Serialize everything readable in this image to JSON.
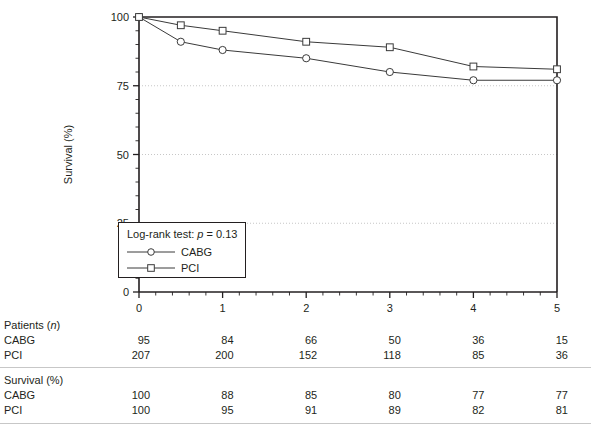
{
  "chart_data": {
    "type": "line",
    "title": "",
    "xlabel": "Years post-treatment",
    "ylabel": "Survival (%)",
    "xlim": [
      0,
      5
    ],
    "ylim": [
      0,
      100
    ],
    "xticks": [
      "0",
      "1",
      "2",
      "3",
      "4",
      "5"
    ],
    "yticks": [
      "0",
      "25",
      "50",
      "75",
      "100"
    ],
    "grid": "horizontal dotted at 25, 50, 75",
    "legend_position": "inset lower-left",
    "annotation": "Log-rank test: p = 0.13",
    "x": [
      0,
      0.5,
      1,
      2,
      3,
      4,
      5
    ],
    "series": [
      {
        "name": "CABG",
        "marker": "circle-open",
        "values": [
          100,
          91,
          88,
          85,
          80,
          77,
          77
        ]
      },
      {
        "name": "PCI",
        "marker": "square-open",
        "values": [
          100,
          97,
          95,
          91,
          89,
          82,
          81
        ]
      }
    ]
  },
  "legend": {
    "stat_prefix": "Log-rank test: ",
    "stat_italic": "p",
    "stat_suffix": " = 0.13",
    "entries": [
      {
        "label": "CABG",
        "marker": "circle-open-icon"
      },
      {
        "label": "PCI",
        "marker": "square-open-icon"
      }
    ]
  },
  "axes": {
    "y_title": "Survival (%)",
    "x_title": "Years post-treatment",
    "y_tick_labels": [
      "100",
      "75",
      "50",
      "25",
      "0"
    ],
    "x_tick_labels": [
      "0",
      "1",
      "2",
      "3",
      "4",
      "5"
    ]
  },
  "tables": {
    "patients": {
      "heading_prefix": "Patients (",
      "heading_italic": "n",
      "heading_suffix": ")",
      "rows": [
        {
          "label": "CABG",
          "values": [
            "95",
            "84",
            "66",
            "50",
            "36",
            "15"
          ]
        },
        {
          "label": "PCI",
          "values": [
            "207",
            "200",
            "152",
            "118",
            "85",
            "36"
          ]
        }
      ]
    },
    "survival": {
      "heading": "Survival (%)",
      "rows": [
        {
          "label": "CABG",
          "values": [
            "100",
            "88",
            "85",
            "80",
            "77",
            "77"
          ]
        },
        {
          "label": "PCI",
          "values": [
            "100",
            "95",
            "91",
            "89",
            "82",
            "81"
          ]
        }
      ]
    }
  }
}
